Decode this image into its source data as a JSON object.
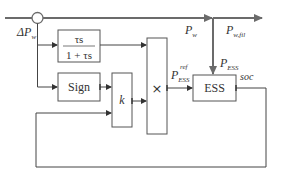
{
  "diagram": {
    "type": "control-block-diagram",
    "colors": {
      "main_power_line": "#6b6b6b",
      "signal_line": "#444444",
      "box_border": "#555555"
    },
    "input": {
      "label_base": "ΔP",
      "label_sub": "w"
    },
    "top_line": {
      "label_pw_base": "P",
      "label_pw_sub": "w",
      "label_pwfil_base": "P",
      "label_pwfil_sub": "w,fil"
    },
    "blocks": {
      "highpass": {
        "numerator": "τs",
        "denominator": "1 + τs"
      },
      "sign": {
        "label": "Sign"
      },
      "gain": {
        "label": "k"
      },
      "multiplier": {
        "label": "×"
      },
      "ess": {
        "label": "ESS"
      }
    },
    "signals": {
      "p_ess_ref_base": "P",
      "p_ess_ref_sub": "ESS",
      "p_ess_ref_sup": "ref",
      "p_ess_base": "P",
      "p_ess_sub": "ESS",
      "soc": "soc"
    }
  }
}
